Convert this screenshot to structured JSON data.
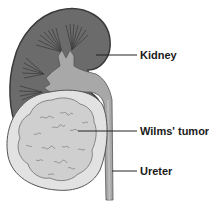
{
  "diagram": {
    "labels": {
      "kidney": "Kidney",
      "tumor": "Wilms' tumor",
      "ureter": "Ureter"
    },
    "colors": {
      "kidney_cortex": "#6b6b6b",
      "kidney_outline": "#3a3a3a",
      "pelvis": "#a8a8a8",
      "tumor_outer": "#e2e2e2",
      "tumor_inner": "#cfcfcf",
      "tumor_lines": "#7a7a7a",
      "ureter": "#9a9a9a",
      "leader_line": "#222222"
    }
  }
}
